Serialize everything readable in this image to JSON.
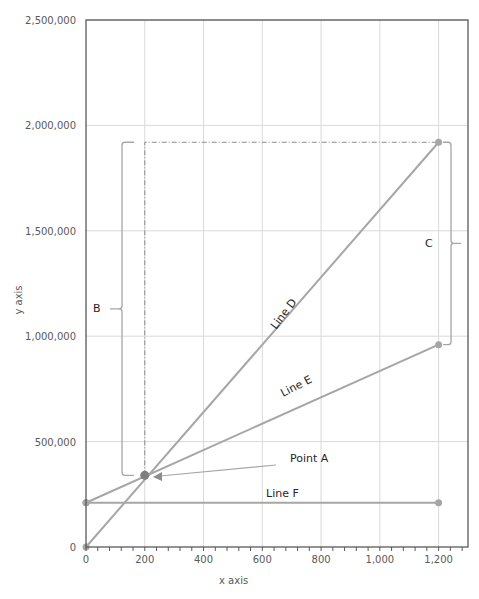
{
  "chart_data": {
    "type": "line",
    "title": "",
    "xlabel": "x axis",
    "ylabel": "y axis",
    "xlim": [
      0,
      1300
    ],
    "ylim": [
      0,
      2500000
    ],
    "grid": true,
    "legend": null,
    "x_ticks": [
      0,
      200,
      400,
      600,
      800,
      1000,
      1200
    ],
    "x_tick_labels": [
      "0",
      "200",
      "400",
      "600",
      "800",
      "1,000",
      "1,200"
    ],
    "y_ticks": [
      0,
      500000,
      1000000,
      1500000,
      2000000,
      2500000
    ],
    "y_tick_labels": [
      "0",
      "500,000",
      "1,000,000",
      "1,500,000",
      "2,000,000",
      "2,500,000"
    ],
    "series": [
      {
        "name": "Line D",
        "x": [
          0,
          1200
        ],
        "y": [
          0,
          1920000
        ]
      },
      {
        "name": "Line E",
        "x": [
          0,
          1200
        ],
        "y": [
          210000,
          960000
        ]
      },
      {
        "name": "Line F",
        "x": [
          0,
          1200
        ],
        "y": [
          210000,
          210000
        ]
      }
    ],
    "annotations": [
      {
        "label": "Point A",
        "x": 200,
        "y": 340000,
        "type": "point-with-arrow"
      },
      {
        "label": "B",
        "type": "brace",
        "x": 200,
        "y_from": 340000,
        "y_to": 1920000,
        "side": "left"
      },
      {
        "label": "C",
        "type": "brace",
        "x": 1200,
        "y_from": 960000,
        "y_to": 1920000,
        "side": "right"
      },
      {
        "type": "dash-dot-guide",
        "points": [
          [
            200,
            340000
          ],
          [
            200,
            1920000
          ],
          [
            1200,
            1920000
          ]
        ]
      }
    ]
  },
  "labels": {
    "line_d": "Line D",
    "line_e": "Line E",
    "line_f": "Line F",
    "point_a": "Point A",
    "brace_b": "B",
    "brace_c": "C"
  },
  "colors": {
    "series": "#a6a6a6",
    "point_a": "#7f7f7f",
    "axis": "#595959",
    "grid": "#d9d9d9"
  }
}
